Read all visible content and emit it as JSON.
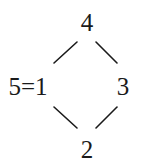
{
  "diagram": {
    "type": "hasse-diagram",
    "nodes": [
      {
        "id": "top",
        "label": "4",
        "x": 87,
        "y": 22
      },
      {
        "id": "left",
        "label": "5=1",
        "x": 28,
        "y": 86
      },
      {
        "id": "right",
        "label": "3",
        "x": 123,
        "y": 86
      },
      {
        "id": "bottom",
        "label": "2",
        "x": 87,
        "y": 149
      }
    ],
    "edges": [
      {
        "from": "top",
        "to": "left"
      },
      {
        "from": "top",
        "to": "right"
      },
      {
        "from": "left",
        "to": "bottom"
      },
      {
        "from": "right",
        "to": "bottom"
      }
    ],
    "colors": {
      "ink": "#1a1a1a",
      "background": "#ffffff"
    }
  }
}
